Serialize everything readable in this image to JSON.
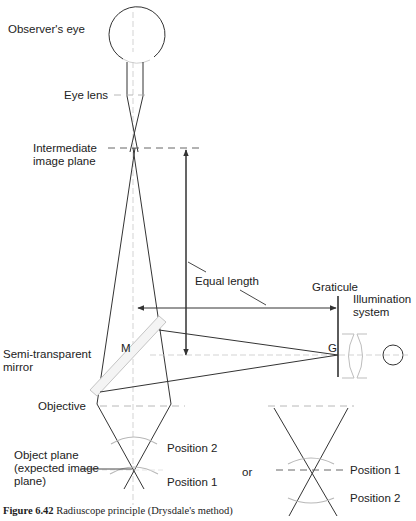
{
  "figure": {
    "caption_number": "Figure 6.42",
    "caption_text": " Radiuscope principle (Drysdale's method)"
  },
  "labels": {
    "observers_eye": "Observer's eye",
    "eye_lens": "Eye lens",
    "intermediate_line1": "Intermediate",
    "intermediate_line2": "image plane",
    "equal_length": "Equal length",
    "graticule": "Graticule",
    "illumination_line1": "Illumination",
    "illumination_line2": "system",
    "mirror_letter": "M",
    "graticule_letter": "G",
    "semi_line1": "Semi-transparent",
    "semi_line2": "mirror",
    "objective": "Objective",
    "object_plane_line1": "Object plane",
    "object_plane_line2": "(expected image",
    "object_plane_line3": "plane)",
    "left_position_2": "Position 2",
    "left_position_1": "Position 1",
    "or": "or",
    "right_position_1": "Position 1",
    "right_position_2": "Position 2"
  },
  "colors": {
    "ink": "#333333",
    "light": "#c8c8c8"
  }
}
